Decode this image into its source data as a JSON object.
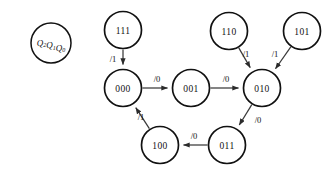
{
  "diagram": {
    "type": "state-transition-diagram",
    "legend": {
      "name": "state-variable-legend",
      "text": "Q2Q1Q0",
      "base": "Q",
      "subscripts": [
        "2",
        "1",
        "0"
      ],
      "cx": 51,
      "cy": 43,
      "r": 20
    },
    "nodes": [
      {
        "id": "111",
        "label": "111",
        "cx": 123,
        "cy": 30,
        "r": 18.5
      },
      {
        "id": "000",
        "label": "000",
        "cx": 123,
        "cy": 88,
        "r": 18.5
      },
      {
        "id": "001",
        "label": "001",
        "cx": 191,
        "cy": 88,
        "r": 18.5
      },
      {
        "id": "010",
        "label": "010",
        "cx": 262,
        "cy": 88,
        "r": 18.5
      },
      {
        "id": "110",
        "label": "110",
        "cx": 229,
        "cy": 31,
        "r": 18.5
      },
      {
        "id": "101",
        "label": "101",
        "cx": 302,
        "cy": 31,
        "r": 18.5
      },
      {
        "id": "100",
        "label": "100",
        "cx": 160,
        "cy": 145,
        "r": 18.5
      },
      {
        "id": "011",
        "label": "011",
        "cx": 227,
        "cy": 145,
        "r": 18.5
      }
    ],
    "edges": [
      {
        "from": "111",
        "to": "000",
        "label": "/1",
        "lx": 113,
        "ly": 59
      },
      {
        "from": "000",
        "to": "001",
        "label": "/0",
        "lx": 157,
        "ly": 79
      },
      {
        "from": "001",
        "to": "010",
        "label": "/0",
        "lx": 226,
        "ly": 79
      },
      {
        "from": "110",
        "to": "010",
        "label": "/1",
        "lx": 246,
        "ly": 54
      },
      {
        "from": "101",
        "to": "010",
        "label": "/1",
        "lx": 275,
        "ly": 54
      },
      {
        "from": "010",
        "to": "011",
        "label": "/0",
        "lx": 258,
        "ly": 120
      },
      {
        "from": "011",
        "to": "100",
        "label": "/0",
        "lx": 194,
        "ly": 136
      },
      {
        "from": "100",
        "to": "000",
        "label": "/1",
        "lx": 141,
        "ly": 117
      }
    ],
    "colors": {
      "background": "#ffffff",
      "node_stroke": "#111111",
      "edge_stroke": "#3a3a3a",
      "text": "#111111"
    }
  }
}
